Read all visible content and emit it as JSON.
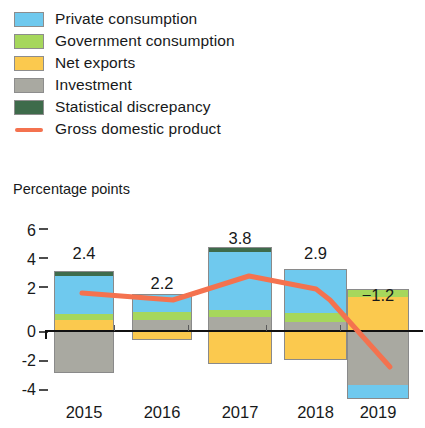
{
  "legend": {
    "items": [
      {
        "label": "Private consumption",
        "color": "#6FC9EE",
        "type": "swatch",
        "icon": "square-swatch-icon"
      },
      {
        "label": "Government consumption",
        "color": "#A6D75C",
        "type": "swatch",
        "icon": "square-swatch-icon"
      },
      {
        "label": "Net exports",
        "color": "#FBC94E",
        "type": "swatch",
        "icon": "square-swatch-icon"
      },
      {
        "label": "Investment",
        "color": "#A9A9A1",
        "type": "swatch",
        "icon": "square-swatch-icon"
      },
      {
        "label": "Statistical discrepancy",
        "color": "#3E6B4B",
        "type": "swatch",
        "icon": "square-swatch-icon"
      },
      {
        "label": "Gross domestic product",
        "color": "#F4724F",
        "type": "line",
        "icon": "line-swatch-icon"
      }
    ]
  },
  "axis": {
    "y_title": "Percentage points",
    "y_ticks": [
      "6",
      "4",
      "2",
      "0",
      "-2",
      "-4"
    ],
    "x_labels": [
      "2015",
      "2016",
      "2017",
      "2018",
      "2019"
    ]
  },
  "chart_data": {
    "type": "bar",
    "title": "",
    "subtitle": "",
    "xlabel": "",
    "ylabel": "Percentage points",
    "ylim": [
      -4.6,
      6.2
    ],
    "yticks": [
      6,
      4,
      2,
      0,
      -2,
      -4
    ],
    "grid": false,
    "stacked": true,
    "legend_position": "top-left",
    "categories": [
      "2015",
      "2016",
      "2017",
      "2018",
      "2019"
    ],
    "series": [
      {
        "name": "Private consumption",
        "color": "#6FC9EE",
        "values": [
          2.6,
          1.2,
          2.8,
          2.9,
          -1.0
        ]
      },
      {
        "name": "Government consumption",
        "color": "#A6D75C",
        "values": [
          0.4,
          0.5,
          0.4,
          0.6,
          0.5
        ]
      },
      {
        "name": "Net exports",
        "color": "#FBC94E",
        "values": [
          0.6,
          -0.6,
          -2.3,
          -2.0,
          2.4
        ]
      },
      {
        "name": "Investment",
        "color": "#A9A9A1",
        "values": [
          -1.5,
          0.8,
          0.9,
          0.2,
          -4.3
        ]
      },
      {
        "name": "Statistical discrepancy",
        "color": "#3E6B4B",
        "values": [
          0.2,
          0.0,
          0.2,
          0.0,
          0.0
        ]
      }
    ],
    "line_series": {
      "name": "Gross domestic product",
      "color": "#F4724F",
      "values": [
        2.4,
        2.2,
        3.8,
        2.9,
        -1.2
      ]
    },
    "value_labels": [
      "2.4",
      "2.2",
      "3.8",
      "2.9",
      "-1.2"
    ]
  },
  "bars": [
    {
      "year": "2015",
      "label": "2.4",
      "segments": [
        {
          "name": "Statistical discrepancy",
          "color": "#3E6B4B",
          "top": 271,
          "bottom": 276
        },
        {
          "name": "Private consumption",
          "color": "#6FC9EE",
          "top": 276,
          "bottom": 314
        },
        {
          "name": "Government consumption",
          "color": "#A6D75C",
          "top": 314,
          "bottom": 320
        },
        {
          "name": "Net exports",
          "color": "#FBC94E",
          "top": 320,
          "bottom": 331
        },
        {
          "name": "Investment",
          "color": "#A9A9A1",
          "top": 331,
          "bottom": 373
        }
      ]
    },
    {
      "year": "2016",
      "label": "2.2",
      "segments": [
        {
          "name": "Private consumption",
          "color": "#6FC9EE",
          "top": 294,
          "bottom": 312
        },
        {
          "name": "Government consumption",
          "color": "#A6D75C",
          "top": 312,
          "bottom": 320
        },
        {
          "name": "Investment",
          "color": "#A9A9A1",
          "top": 320,
          "bottom": 331
        },
        {
          "name": "Net exports",
          "color": "#FBC94E",
          "top": 331,
          "bottom": 340
        }
      ]
    },
    {
      "year": "2017",
      "label": "3.8",
      "segments": [
        {
          "name": "Statistical discrepancy",
          "color": "#3E6B4B",
          "top": 247,
          "bottom": 252
        },
        {
          "name": "Private consumption",
          "color": "#6FC9EE",
          "top": 252,
          "bottom": 310
        },
        {
          "name": "Government consumption",
          "color": "#A6D75C",
          "top": 310,
          "bottom": 317
        },
        {
          "name": "Investment",
          "color": "#A9A9A1",
          "top": 317,
          "bottom": 331
        },
        {
          "name": "Net exports",
          "color": "#FBC94E",
          "top": 331,
          "bottom": 364
        }
      ]
    },
    {
      "year": "2018",
      "label": "2.9",
      "segments": [
        {
          "name": "Private consumption",
          "color": "#6FC9EE",
          "top": 269,
          "bottom": 313
        },
        {
          "name": "Government consumption",
          "color": "#A6D75C",
          "top": 313,
          "bottom": 322
        },
        {
          "name": "Investment",
          "color": "#A9A9A1",
          "top": 322,
          "bottom": 331
        },
        {
          "name": "Net exports",
          "color": "#FBC94E",
          "top": 331,
          "bottom": 360
        }
      ]
    },
    {
      "year": "2019",
      "label": "-1.2",
      "segments": [
        {
          "name": "Government consumption",
          "color": "#A6D75C",
          "top": 289,
          "bottom": 297
        },
        {
          "name": "Net exports",
          "color": "#FBC94E",
          "top": 297,
          "bottom": 331
        },
        {
          "name": "Investment",
          "color": "#A9A9A1",
          "top": 331,
          "bottom": 385
        },
        {
          "name": "Private consumption",
          "color": "#6FC9EE",
          "top": 385,
          "bottom": 399
        }
      ]
    }
  ],
  "geometry": {
    "bar_x": [
      54,
      132,
      208,
      284,
      347
    ],
    "bar_width": [
      60,
      60,
      64,
      63,
      62
    ],
    "label_y": [
      244,
      274,
      229,
      244,
      286
    ],
    "ytick_y": [
      222,
      251,
      280,
      323,
      352,
      381
    ],
    "dash_y": [
      228,
      257,
      286,
      331,
      360,
      389
    ],
    "xtick_x": [
      114,
      188,
      266,
      340
    ],
    "xlabel_y": 403,
    "zero_y": 331
  },
  "gdp_path": "M82,293 L173,300 L249,276 L316,289 L330,300 L390,367"
}
